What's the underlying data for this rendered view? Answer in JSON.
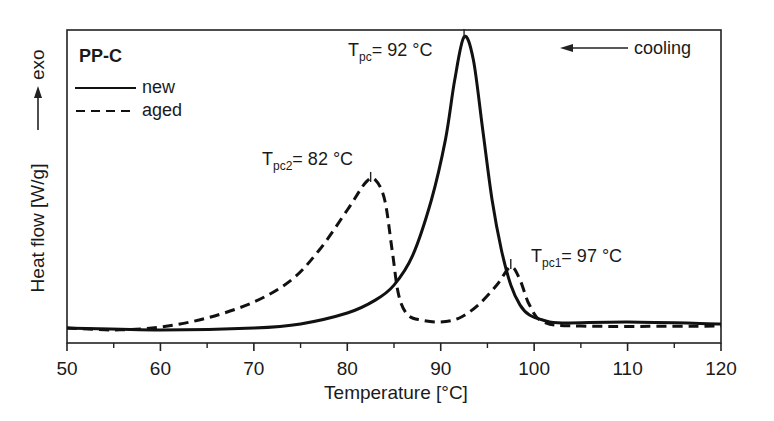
{
  "chart_data": {
    "type": "line",
    "title": "PP-C",
    "xlabel": "Temperature [°C]",
    "ylabel": "Heat flow [W/g]",
    "ylabel_arrow": "exo",
    "direction_annotation": "cooling",
    "xlim": [
      50,
      120
    ],
    "ylim": [
      0,
      100
    ],
    "x_ticks": [
      50,
      60,
      70,
      80,
      90,
      100,
      110,
      120
    ],
    "x_minor_ticks": [
      55,
      65,
      75,
      85,
      95,
      105,
      115
    ],
    "y_ticks": [],
    "grid": false,
    "legend_position": "upper-left",
    "legend": [
      {
        "label": "new",
        "style": "solid"
      },
      {
        "label": "aged",
        "style": "dashed"
      }
    ],
    "series": [
      {
        "name": "new",
        "style": "solid",
        "x": [
          50,
          60,
          70,
          75,
          80,
          83,
          85,
          87,
          89,
          90.5,
          91.5,
          92.5,
          93.5,
          94.5,
          95.5,
          96.5,
          97.5,
          98.5,
          99.5,
          101,
          103,
          110,
          120
        ],
        "values": [
          4.8,
          4.2,
          4.8,
          6.1,
          9.6,
          13.7,
          18.5,
          28,
          45.7,
          64.9,
          84,
          97.8,
          90.4,
          68,
          45.7,
          29.7,
          18.5,
          12.1,
          8.9,
          7.3,
          6.4,
          6.7,
          6.1
        ]
      },
      {
        "name": "aged",
        "style": "dashed",
        "x": [
          50,
          55,
          60,
          65,
          70,
          74,
          77,
          80,
          82,
          83,
          84,
          84.8,
          85.5,
          86.5,
          88,
          90,
          92,
          94,
          96,
          97.5,
          98.5,
          99.5,
          101,
          105,
          120
        ],
        "values": [
          4.8,
          4.2,
          5.1,
          8,
          13.1,
          20.1,
          29.7,
          42.5,
          51.4,
          52.1,
          45.7,
          29.7,
          15.3,
          8.9,
          7.3,
          6.7,
          8,
          12.1,
          18.5,
          24.3,
          20.1,
          12.1,
          6.7,
          5.4,
          5.4
        ]
      }
    ],
    "annotations": [
      {
        "main": "T",
        "sub": "pc",
        "text": "= 92 °C",
        "x": 92.5,
        "y": 97.8,
        "series": "new"
      },
      {
        "main": "T",
        "sub": "pc2",
        "text": "= 82 °C",
        "x": 82.5,
        "y": 52.1,
        "series": "aged"
      },
      {
        "main": "T",
        "sub": "pc1",
        "text": "= 97 °C",
        "x": 97.5,
        "y": 24.3,
        "series": "aged"
      }
    ]
  }
}
